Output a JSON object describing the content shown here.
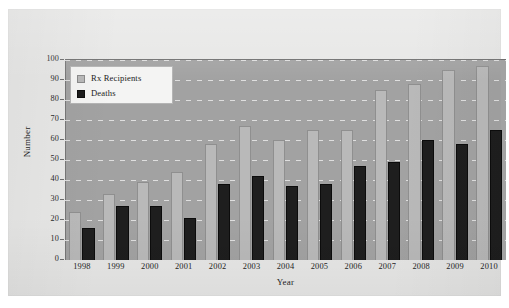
{
  "chart_data": {
    "type": "bar",
    "title": "",
    "xlabel": "Year",
    "ylabel": "Number",
    "categories": [
      "1998",
      "1999",
      "2000",
      "2001",
      "2002",
      "2003",
      "2004",
      "2005",
      "2006",
      "2007",
      "2008",
      "2009",
      "2010"
    ],
    "series": [
      {
        "name": "Rx Recipients",
        "color": "#b9b9b9",
        "values": [
          24,
          33,
          39,
          44,
          58,
          67,
          60,
          65,
          65,
          85,
          88,
          95,
          97
        ]
      },
      {
        "name": "Deaths",
        "color": "#1e1e1e",
        "values": [
          16,
          27,
          27,
          21,
          38,
          42,
          37,
          38,
          47,
          49,
          60,
          58,
          65
        ]
      }
    ],
    "ylim": [
      0,
      100
    ],
    "ytick_labels": [
      "0",
      "10",
      "20",
      "30",
      "40",
      "50",
      "60",
      "70",
      "80",
      "90",
      "100"
    ],
    "ytick_values": [
      0,
      10,
      20,
      30,
      40,
      50,
      60,
      70,
      80,
      90,
      100
    ],
    "grid": true,
    "grid_style": "dashed-white-horizontal",
    "legend_position": "upper-left-inside",
    "plot_background": "#a2a2a2",
    "figure_background": "#e7e7e6"
  },
  "legend": {
    "entries": [
      {
        "label": "Rx Recipients",
        "icon": "square-swatch-light"
      },
      {
        "label": "Deaths",
        "icon": "square-swatch-dark"
      }
    ]
  },
  "axes": {
    "y_title": "Number",
    "x_title": "Year"
  }
}
